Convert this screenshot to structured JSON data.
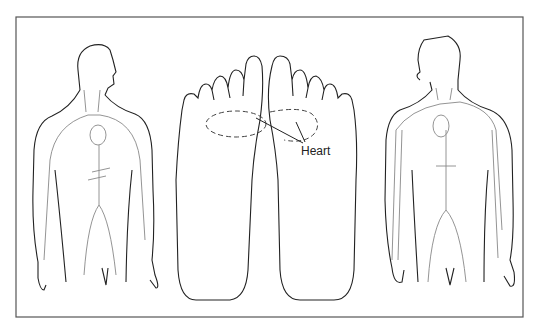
{
  "diagram": {
    "title": "",
    "panels": [
      {
        "id": "left-figure",
        "description": "Male torso (left view) with circulatory system: heart, aorta, arteries to arms and legs"
      },
      {
        "id": "feet",
        "description": "Soles of both feet with dashed oval reflexology zone for the heart"
      },
      {
        "id": "right-figure",
        "description": "Male torso (right view) with circulatory system and veins in arms"
      }
    ],
    "labels": {
      "heart": "Heart"
    },
    "colors": {
      "line": "#222222",
      "frame": "#555555",
      "vessel": "#888888",
      "background": "#ffffff"
    }
  }
}
